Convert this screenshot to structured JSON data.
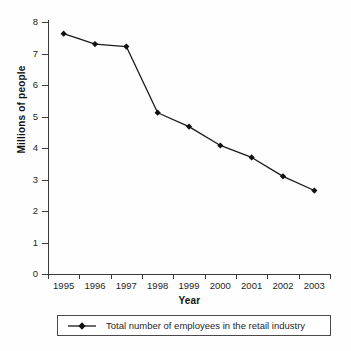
{
  "chart_data": {
    "type": "line",
    "title": "",
    "xlabel": "Year",
    "ylabel": "Millions of people",
    "categories": [
      "1995",
      "1996",
      "1997",
      "1998",
      "1999",
      "2000",
      "2001",
      "2002",
      "2003"
    ],
    "series": [
      {
        "name": "Total number of employees in the retail industry",
        "values": [
          7.63,
          7.3,
          7.22,
          5.12,
          4.68,
          4.08,
          3.7,
          3.1,
          2.65
        ]
      }
    ],
    "ylim": [
      0,
      8
    ],
    "yticks": [
      0,
      1,
      2,
      3,
      4,
      5,
      6,
      7,
      8
    ],
    "ytick_labels": [
      "0",
      "1",
      "2",
      "3",
      "4",
      "5",
      "6",
      "7",
      "8"
    ],
    "grid": false,
    "legend_position": "bottom",
    "marker": "diamond",
    "line_color": "#1a1a1a",
    "marker_color": "#111111"
  },
  "legend": {
    "entries": [
      {
        "label": "Total number of employees in the retail industry",
        "marker": "line-diamond-marker"
      }
    ]
  },
  "axes": {
    "x_title": "Year",
    "y_title": "Millions of people"
  }
}
